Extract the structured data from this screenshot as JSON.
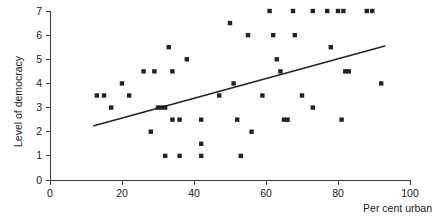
{
  "chart_data": {
    "type": "scatter",
    "title": "",
    "subtitle": "",
    "xlabel": "Per cent urban",
    "ylabel": "Level of democracy",
    "xlim": [
      0,
      100
    ],
    "ylim": [
      0,
      7
    ],
    "xticks": [
      0,
      20,
      40,
      60,
      80,
      100
    ],
    "yticks": [
      0,
      1,
      2,
      3,
      4,
      5,
      6,
      7
    ],
    "xtick_labels": [
      "0",
      "20",
      "40",
      "60",
      "80",
      "100"
    ],
    "ytick_labels": [
      "0",
      "1",
      "2",
      "3",
      "4",
      "5",
      "6",
      "7"
    ],
    "grid": false,
    "legend": null,
    "marker": "square",
    "marker_color": "#232323",
    "points": [
      [
        13,
        3.5
      ],
      [
        15,
        3.5
      ],
      [
        17,
        3.0
      ],
      [
        20,
        4.0
      ],
      [
        22,
        3.5
      ],
      [
        26,
        4.5
      ],
      [
        28,
        2.0
      ],
      [
        29,
        4.5
      ],
      [
        30,
        3.0
      ],
      [
        31,
        3.0
      ],
      [
        32,
        3.0
      ],
      [
        32,
        1.0
      ],
      [
        33,
        5.5
      ],
      [
        34,
        4.5
      ],
      [
        34,
        2.5
      ],
      [
        36,
        2.5
      ],
      [
        36,
        1.0
      ],
      [
        38,
        5.0
      ],
      [
        42,
        2.5
      ],
      [
        42,
        1.5
      ],
      [
        42,
        1.0
      ],
      [
        47,
        3.5
      ],
      [
        50,
        6.5
      ],
      [
        51,
        4.0
      ],
      [
        52,
        2.5
      ],
      [
        53,
        1.0
      ],
      [
        55,
        6.0
      ],
      [
        56,
        2.0
      ],
      [
        59,
        3.5
      ],
      [
        61,
        7.0
      ],
      [
        62,
        6.0
      ],
      [
        63,
        5.0
      ],
      [
        64,
        4.5
      ],
      [
        65,
        2.5
      ],
      [
        66,
        2.5
      ],
      [
        67.5,
        7.0
      ],
      [
        68,
        6.0
      ],
      [
        70,
        3.5
      ],
      [
        73,
        7.0
      ],
      [
        73,
        3.0
      ],
      [
        77,
        7.0
      ],
      [
        78,
        5.5
      ],
      [
        80,
        7.0
      ],
      [
        81.5,
        7.0
      ],
      [
        81,
        2.5
      ],
      [
        82,
        4.5
      ],
      [
        83,
        4.5
      ],
      [
        88,
        7.0
      ],
      [
        89.5,
        7.0
      ],
      [
        92,
        4.0
      ]
    ],
    "trend_line": {
      "x0": 12.2,
      "y0": 2.25,
      "x1": 93.0,
      "y1": 5.55,
      "color": "#232323"
    }
  }
}
